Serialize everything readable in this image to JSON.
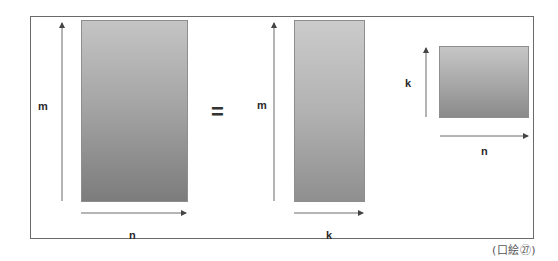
{
  "figure": {
    "caption": "(口絵㉗)",
    "equals_sign": "=",
    "colors": {
      "frame": "#6a6a6a",
      "arrow": "#555555",
      "matrix_gradient_top": "#c4c4c4",
      "matrix_gradient_bottom": "#7c7c7c"
    }
  },
  "matrices": [
    {
      "name": "left-matrix",
      "row_label": "m",
      "col_label": "n"
    },
    {
      "name": "factor-matrix-1",
      "row_label": "m",
      "col_label": "k"
    },
    {
      "name": "factor-matrix-2",
      "row_label": "k",
      "col_label": "n"
    }
  ]
}
